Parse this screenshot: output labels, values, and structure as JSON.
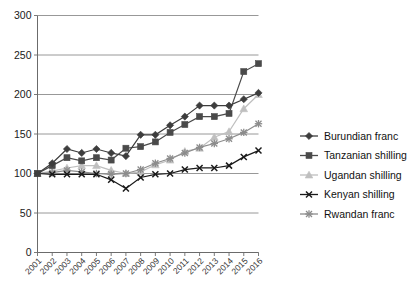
{
  "chart_data": {
    "type": "line",
    "title": "",
    "subtitle": "",
    "xlabel": "",
    "ylabel": "",
    "xlim": [
      2001,
      2016
    ],
    "ylim": [
      0,
      300
    ],
    "yticks": [
      0,
      50,
      100,
      150,
      200,
      250,
      300
    ],
    "grid": true,
    "legend_position": "right",
    "categories": [
      "2001",
      "2002",
      "2003",
      "2004",
      "2005",
      "2006",
      "2007",
      "2008",
      "2009",
      "2010",
      "2011",
      "2012",
      "2013",
      "2014",
      "2015",
      "2016"
    ],
    "series": [
      {
        "name": "Burundian franc",
        "marker": "diamond",
        "color": "#3d3d3d",
        "values": [
          100,
          113,
          131,
          126,
          131,
          126,
          122,
          149,
          149,
          161,
          172,
          186,
          186,
          186,
          194,
          202
        ]
      },
      {
        "name": "Tanzanian shilling",
        "marker": "square",
        "color": "#4a4a4a",
        "values": [
          100,
          110,
          120,
          116,
          120,
          117,
          132,
          134,
          140,
          152,
          162,
          172,
          172,
          176,
          229,
          239
        ]
      },
      {
        "name": "Ugandan shilling",
        "marker": "triangle",
        "color": "#bfbfbf",
        "values": [
          100,
          103,
          107,
          110,
          110,
          104,
          100,
          102,
          111,
          117,
          128,
          132,
          146,
          153,
          182,
          200
        ]
      },
      {
        "name": "Kenyan shilling",
        "marker": "cross",
        "color": "#1a1a1a",
        "values": [
          100,
          99,
          99,
          99,
          99,
          92,
          81,
          95,
          99,
          100,
          105,
          107,
          107,
          110,
          121,
          129
        ]
      },
      {
        "name": "Rwandan franc",
        "marker": "star",
        "color": "#8c8c8c",
        "values": [
          100,
          101,
          104,
          102,
          100,
          99,
          100,
          105,
          113,
          119,
          126,
          133,
          138,
          144,
          152,
          163
        ]
      }
    ]
  },
  "axis": {
    "y_labels": [
      "300",
      "250",
      "200",
      "150",
      "100",
      "50",
      "0"
    ],
    "x_labels": [
      "2001",
      "2002",
      "2003",
      "2004",
      "2005",
      "2006",
      "2007",
      "2008",
      "2009",
      "2010",
      "2011",
      "2012",
      "2013",
      "2014",
      "2015",
      "2016"
    ]
  },
  "legend": {
    "entries": [
      {
        "label": "Burundian franc"
      },
      {
        "label": "Tanzanian shilling"
      },
      {
        "label": "Ugandan shilling"
      },
      {
        "label": "Kenyan shilling"
      },
      {
        "label": "Rwandan franc"
      }
    ]
  }
}
